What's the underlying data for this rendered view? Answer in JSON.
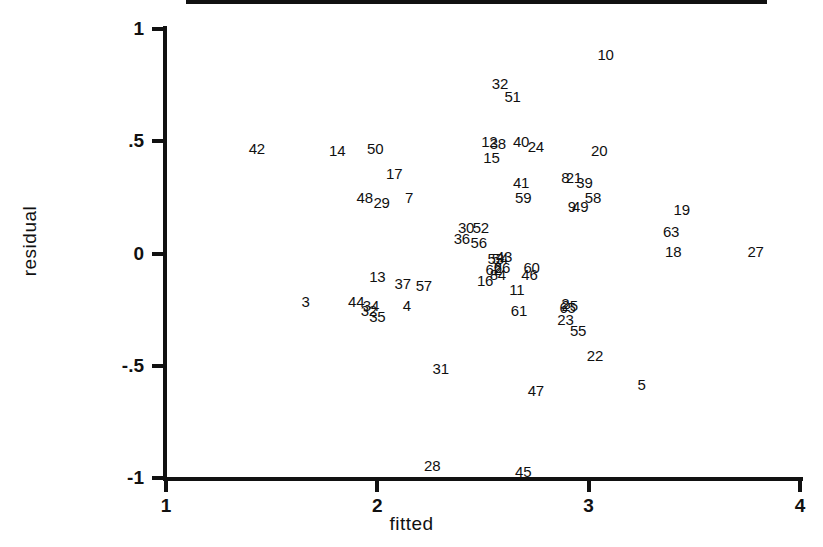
{
  "chart_data": {
    "type": "scatter",
    "title": "",
    "xlabel": "fitted",
    "ylabel": "residual",
    "xlim": [
      1,
      4
    ],
    "ylim": [
      -1,
      1
    ],
    "xticks": [
      "1",
      "2",
      "3",
      "4"
    ],
    "xtick_values": [
      1,
      2,
      3,
      4
    ],
    "yticks": [
      "1",
      ".5",
      "0",
      "-.5",
      "-1"
    ],
    "ytick_values": [
      1,
      0.5,
      0,
      -0.5,
      -1
    ],
    "grid": false,
    "legend": null,
    "marker_style": "case-number-label",
    "reference_lines": [
      {
        "name": "zero-residual-line",
        "type": "horizontal",
        "y": 0.0,
        "x_start": 1.11,
        "x_end": 3.85
      }
    ],
    "points": [
      {
        "label": "42",
        "x": 1.43,
        "y": 0.47
      },
      {
        "label": "14",
        "x": 1.81,
        "y": 0.46
      },
      {
        "label": "50",
        "x": 1.99,
        "y": 0.47
      },
      {
        "label": "17",
        "x": 2.08,
        "y": 0.36
      },
      {
        "label": "48",
        "x": 1.94,
        "y": 0.25
      },
      {
        "label": "29",
        "x": 2.02,
        "y": 0.23
      },
      {
        "label": "7",
        "x": 2.15,
        "y": 0.25
      },
      {
        "label": "13",
        "x": 2.0,
        "y": -0.1
      },
      {
        "label": "37",
        "x": 2.12,
        "y": -0.13
      },
      {
        "label": "57",
        "x": 2.22,
        "y": -0.14
      },
      {
        "label": "3",
        "x": 1.66,
        "y": -0.21
      },
      {
        "label": "44",
        "x": 1.9,
        "y": -0.21
      },
      {
        "label": "34",
        "x": 1.97,
        "y": -0.23
      },
      {
        "label": "32",
        "x": 1.96,
        "y": -0.25
      },
      {
        "label": "35",
        "x": 2.0,
        "y": -0.28
      },
      {
        "label": "4",
        "x": 2.14,
        "y": -0.23
      },
      {
        "label": "31",
        "x": 2.3,
        "y": -0.51
      },
      {
        "label": "28",
        "x": 2.26,
        "y": -0.94
      },
      {
        "label": "30",
        "x": 2.42,
        "y": 0.12
      },
      {
        "label": "52",
        "x": 2.49,
        "y": 0.12
      },
      {
        "label": "36",
        "x": 2.4,
        "y": 0.07
      },
      {
        "label": "56",
        "x": 2.48,
        "y": 0.05
      },
      {
        "label": "12",
        "x": 2.53,
        "y": 0.5
      },
      {
        "label": "38",
        "x": 2.57,
        "y": 0.49
      },
      {
        "label": "15",
        "x": 2.54,
        "y": 0.43
      },
      {
        "label": "32b",
        "x": 2.58,
        "y": 0.76
      },
      {
        "label": "51",
        "x": 2.64,
        "y": 0.7
      },
      {
        "label": "40",
        "x": 2.68,
        "y": 0.5
      },
      {
        "label": "24",
        "x": 2.75,
        "y": 0.48
      },
      {
        "label": "41",
        "x": 2.68,
        "y": 0.32
      },
      {
        "label": "59",
        "x": 2.69,
        "y": 0.25
      },
      {
        "label": "53",
        "x": 2.56,
        "y": -0.02
      },
      {
        "label": "54",
        "x": 2.58,
        "y": -0.02
      },
      {
        "label": "43",
        "x": 2.6,
        "y": -0.01
      },
      {
        "label": "6",
        "x": 2.57,
        "y": -0.06
      },
      {
        "label": "26",
        "x": 2.59,
        "y": -0.06
      },
      {
        "label": "62",
        "x": 2.55,
        "y": -0.07
      },
      {
        "label": "84",
        "x": 2.57,
        "y": -0.09
      },
      {
        "label": "16",
        "x": 2.51,
        "y": -0.12
      },
      {
        "label": "11",
        "x": 2.66,
        "y": -0.16
      },
      {
        "label": "60",
        "x": 2.73,
        "y": -0.06
      },
      {
        "label": "46",
        "x": 2.72,
        "y": -0.09
      },
      {
        "label": "61",
        "x": 2.67,
        "y": -0.25
      },
      {
        "label": "47",
        "x": 2.75,
        "y": -0.61
      },
      {
        "label": "45",
        "x": 2.69,
        "y": -0.97
      },
      {
        "label": "8",
        "x": 2.89,
        "y": 0.34
      },
      {
        "label": "21",
        "x": 2.93,
        "y": 0.34
      },
      {
        "label": "39",
        "x": 2.98,
        "y": 0.32
      },
      {
        "label": "20",
        "x": 3.05,
        "y": 0.46
      },
      {
        "label": "9",
        "x": 2.92,
        "y": 0.21
      },
      {
        "label": "49",
        "x": 2.96,
        "y": 0.21
      },
      {
        "label": "58",
        "x": 3.02,
        "y": 0.25
      },
      {
        "label": "2",
        "x": 2.89,
        "y": -0.22
      },
      {
        "label": "25",
        "x": 2.91,
        "y": -0.23
      },
      {
        "label": "65",
        "x": 2.9,
        "y": -0.24
      },
      {
        "label": "23",
        "x": 2.89,
        "y": -0.29
      },
      {
        "label": "55",
        "x": 2.95,
        "y": -0.34
      },
      {
        "label": "22",
        "x": 3.03,
        "y": -0.45
      },
      {
        "label": "5",
        "x": 3.25,
        "y": -0.58
      },
      {
        "label": "10",
        "x": 3.08,
        "y": 0.89
      },
      {
        "label": "19",
        "x": 3.44,
        "y": 0.2
      },
      {
        "label": "63",
        "x": 3.39,
        "y": 0.1
      },
      {
        "label": "18",
        "x": 3.4,
        "y": 0.01
      },
      {
        "label": "27",
        "x": 3.79,
        "y": 0.01
      }
    ]
  },
  "axis": {
    "x_title": "fitted",
    "y_title": "residual"
  }
}
